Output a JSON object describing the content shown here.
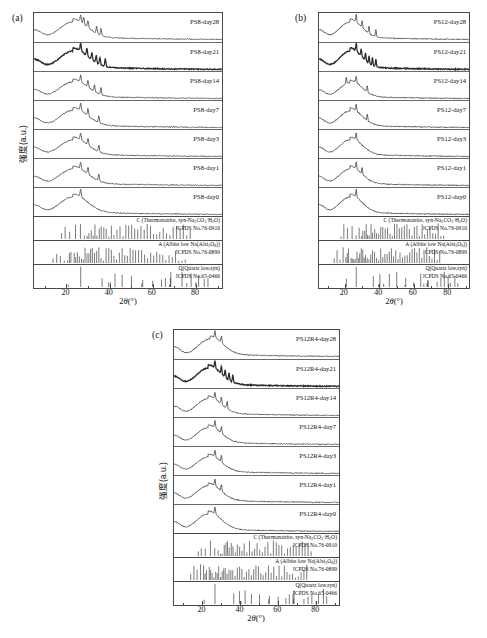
{
  "figure": {
    "axis_x_label_prefix": "2",
    "axis_x_label_theta": "θ",
    "axis_x_label_unit": "(°)",
    "axis_y_label": "强度(a.u.)",
    "x_ticks": [
      "20",
      "40",
      "60",
      "80"
    ],
    "x_range": [
      5,
      92
    ]
  },
  "reference_patterns": [
    {
      "key": "thermonatrite",
      "name_prefix": "C (Thermonatrite, syn-Na",
      "name_sub1": "2",
      "name_mid1": "CO",
      "name_sub2": "3",
      "name_mid2": "·H",
      "name_sub3": "2",
      "name_end": "O)",
      "name_plain": "C (Thermonatrite, syn-Na2CO3·H2O)",
      "card": "JCPDS No.76-0910"
    },
    {
      "key": "albite",
      "name_prefix": "A (Albite low Na(Alsi",
      "name_sub1": "3",
      "name_mid1": "O",
      "name_sub2": "8",
      "name_end": "))",
      "name_plain": "A (Albite low Na(Alsi3O8))",
      "card": "JCPDS No.76-0899"
    },
    {
      "key": "quartz",
      "name_plain": "Q(Quartz low,syn)",
      "card": "JCPDS No.65-0466"
    }
  ],
  "panels": [
    {
      "id": "a",
      "label": "(a)",
      "sample": "PS8",
      "curves": [
        {
          "label": "PS8-day28"
        },
        {
          "label": "PS8-day21"
        },
        {
          "label": "PS8-day14"
        },
        {
          "label": "PS8-day7"
        },
        {
          "label": "PS8-day3"
        },
        {
          "label": "PS8-day1"
        },
        {
          "label": "PS8-day0"
        }
      ]
    },
    {
      "id": "b",
      "label": "(b)",
      "sample": "PS12",
      "curves": [
        {
          "label": "PS12-day28"
        },
        {
          "label": "PS12-day21"
        },
        {
          "label": "PS12-day14"
        },
        {
          "label": "PS12-day7"
        },
        {
          "label": "PS12-day3"
        },
        {
          "label": "PS12-day1"
        },
        {
          "label": "PS12-day0"
        }
      ]
    },
    {
      "id": "c",
      "label": "(c)",
      "sample": "PS12R4",
      "curves": [
        {
          "label": "PS12R4-day28"
        },
        {
          "label": "PS12R4-day21"
        },
        {
          "label": "PS12R4-day14"
        },
        {
          "label": "PS12R4-day7"
        },
        {
          "label": "PS12R4-day3"
        },
        {
          "label": "PS12R4-day1"
        },
        {
          "label": "PS12R4-day0"
        }
      ]
    }
  ],
  "chart_data": {
    "type": "line",
    "title": "",
    "xlabel": "2θ(°)",
    "ylabel": "强度(a.u.)",
    "xlim": [
      5,
      92
    ],
    "grid": false,
    "legend": "inline-right",
    "panels": [
      {
        "name": "(a) PS8",
        "series": [
          {
            "name": "PS8-day28",
            "amorphous_hump_center_2theta": 23,
            "hump_relative_height": 1.0,
            "sharp_peaks_2theta": [
              26.6,
              28,
              30,
              34,
              36
            ]
          },
          {
            "name": "PS8-day21",
            "amorphous_hump_center_2theta": 23,
            "hump_relative_height": 1.05,
            "sharp_peaks_2theta": [
              26.6,
              29.5,
              31.8,
              33.8,
              35.5,
              38
            ]
          },
          {
            "name": "PS8-day14",
            "amorphous_hump_center_2theta": 23,
            "hump_relative_height": 0.95,
            "sharp_peaks_2theta": [
              26.6,
              30,
              33,
              36
            ]
          },
          {
            "name": "PS8-day7",
            "amorphous_hump_center_2theta": 23,
            "hump_relative_height": 0.98,
            "sharp_peaks_2theta": [
              26.6,
              30,
              35
            ]
          },
          {
            "name": "PS8-day3",
            "amorphous_hump_center_2theta": 23,
            "hump_relative_height": 0.95,
            "sharp_peaks_2theta": [
              26.6,
              30,
              35
            ]
          },
          {
            "name": "PS8-day1",
            "amorphous_hump_center_2theta": 23,
            "hump_relative_height": 0.95,
            "sharp_peaks_2theta": [
              26.6,
              30,
              35
            ]
          },
          {
            "name": "PS8-day0",
            "amorphous_hump_center_2theta": 23,
            "hump_relative_height": 1.0,
            "sharp_peaks_2theta": [
              26.6
            ]
          }
        ]
      },
      {
        "name": "(b) PS12",
        "series": [
          {
            "name": "PS12-day28",
            "amorphous_hump_center_2theta": 23,
            "hump_relative_height": 1.0,
            "sharp_peaks_2theta": [
              26.6,
              30,
              34,
              38
            ]
          },
          {
            "name": "PS12-day21",
            "amorphous_hump_center_2theta": 23,
            "hump_relative_height": 1.05,
            "sharp_peaks_2theta": [
              26.6,
              29.5,
              32,
              34,
              36,
              38
            ]
          },
          {
            "name": "PS12-day14",
            "amorphous_hump_center_2theta": 23,
            "hump_relative_height": 0.9,
            "sharp_peaks_2theta": [
              20.8,
              26.6,
              33
            ]
          },
          {
            "name": "PS12-day7",
            "amorphous_hump_center_2theta": 23,
            "hump_relative_height": 0.95,
            "sharp_peaks_2theta": [
              26.6,
              33
            ]
          },
          {
            "name": "PS12-day3",
            "amorphous_hump_center_2theta": 23,
            "hump_relative_height": 0.95,
            "sharp_peaks_2theta": [
              26.6
            ]
          },
          {
            "name": "PS12-day1",
            "amorphous_hump_center_2theta": 23,
            "hump_relative_height": 0.95,
            "sharp_peaks_2theta": [
              26.6,
              30
            ]
          },
          {
            "name": "PS12-day0",
            "amorphous_hump_center_2theta": 23,
            "hump_relative_height": 1.0,
            "sharp_peaks_2theta": [
              26.6
            ]
          }
        ]
      },
      {
        "name": "(c) PS12R4",
        "series": [
          {
            "name": "PS12R4-day28",
            "amorphous_hump_center_2theta": 24,
            "hump_relative_height": 1.0,
            "sharp_peaks_2theta": [
              26.6,
              30
            ]
          },
          {
            "name": "PS12R4-day21",
            "amorphous_hump_center_2theta": 23,
            "hump_relative_height": 1.05,
            "sharp_peaks_2theta": [
              26.6,
              30,
              32,
              34,
              36
            ]
          },
          {
            "name": "PS12R4-day14",
            "amorphous_hump_center_2theta": 23,
            "hump_relative_height": 0.95,
            "sharp_peaks_2theta": [
              26.6,
              30,
              33
            ]
          },
          {
            "name": "PS12R4-day7",
            "amorphous_hump_center_2theta": 23,
            "hump_relative_height": 0.95,
            "sharp_peaks_2theta": [
              26.6,
              30
            ]
          },
          {
            "name": "PS12R4-day3",
            "amorphous_hump_center_2theta": 23,
            "hump_relative_height": 0.95,
            "sharp_peaks_2theta": [
              26.6,
              30
            ]
          },
          {
            "name": "PS12R4-day1",
            "amorphous_hump_center_2theta": 23,
            "hump_relative_height": 0.95,
            "sharp_peaks_2theta": [
              26.6,
              30
            ]
          },
          {
            "name": "PS12R4-day0",
            "amorphous_hump_center_2theta": 23,
            "hump_relative_height": 1.0,
            "sharp_peaks_2theta": [
              26.6
            ]
          }
        ]
      }
    ],
    "reference_sticks": {
      "thermonatrite_2theta": [
        17.8,
        19.4,
        21.5,
        24.2,
        26.5,
        28.3,
        29.6,
        30.4,
        31.5,
        32.4,
        33.2,
        34.1,
        35.2,
        36.1,
        37.3,
        38.4,
        39.6,
        40.8,
        42.0,
        43.4,
        44.8,
        46.2,
        47.5,
        48.8,
        50.2,
        51.6,
        53.0,
        54.5,
        56.0,
        57.4,
        58.9,
        60.3,
        61.8,
        63.2,
        64.8,
        66.3,
        67.9,
        69.4,
        71.0,
        72.6,
        74.1,
        75.7,
        77.3
      ],
      "albite_2theta": [
        13.8,
        15.5,
        17.2,
        19.0,
        20.6,
        21.4,
        22.1,
        23.6,
        24.3,
        25.1,
        26.0,
        27.0,
        27.8,
        28.6,
        29.5,
        30.4,
        31.2,
        32.0,
        33.0,
        34.0,
        35.0,
        36.0,
        37.2,
        38.4,
        39.6,
        40.8,
        42.0,
        43.2,
        44.5,
        45.8,
        47.0,
        48.2,
        49.5,
        50.8,
        52.0,
        53.4,
        54.8,
        56.2,
        57.6,
        59.0,
        60.4,
        61.8,
        63.2,
        64.6,
        66.0,
        67.5,
        69.0,
        70.5,
        72.0,
        73.5,
        75.0
      ],
      "quartz_2theta": [
        20.9,
        26.6,
        36.5,
        39.5,
        40.3,
        42.5,
        45.8,
        50.1,
        54.9,
        55.3,
        59.9,
        64.0,
        65.8,
        67.7,
        68.1,
        68.3,
        73.5,
        75.7,
        77.7,
        79.9,
        81.2,
        83.8,
        85.5
      ]
    }
  }
}
